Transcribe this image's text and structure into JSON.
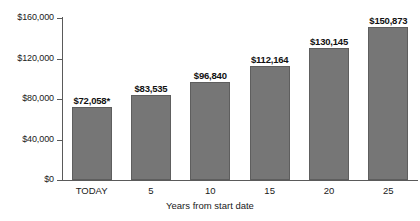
{
  "chart_data": {
    "type": "bar",
    "title": "",
    "subtitle": "",
    "xlabel": "Years from start date",
    "ylabel": "",
    "categories": [
      "TODAY",
      "5",
      "10",
      "15",
      "20",
      "25"
    ],
    "values": [
      72058,
      83535,
      96840,
      112164,
      130145,
      150873
    ],
    "data_labels": [
      "$72,058*",
      "$83,535",
      "$96,840",
      "$112,164",
      "$130,145",
      "$150,873"
    ],
    "ylim": [
      0,
      160000
    ],
    "ytick_values": [
      0,
      40000,
      80000,
      120000,
      160000
    ],
    "ytick_labels": [
      "$0",
      "$40,000",
      "$80,000",
      "$120,000",
      "$160,000"
    ],
    "grid": false,
    "legend": null,
    "bar_color": "#767676",
    "bar_border_color": "#5e5e5e",
    "axis_color": "#5a5a5a",
    "background_color": "#ffffff",
    "annotations": [
      "*"
    ]
  }
}
